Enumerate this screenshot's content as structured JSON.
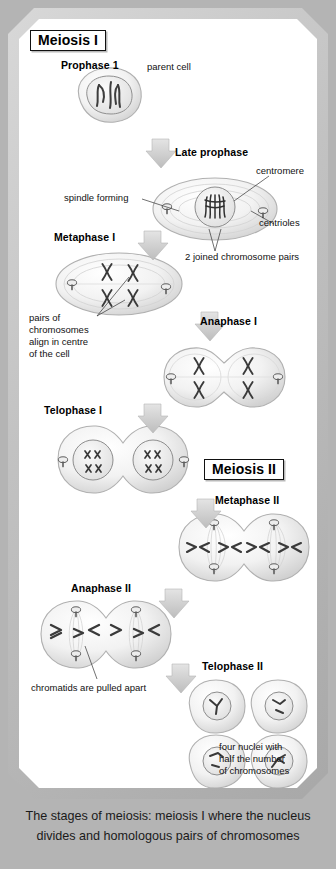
{
  "diagram": {
    "sections": [
      {
        "id": "meiosis-1",
        "label": "Meiosis I"
      },
      {
        "id": "meiosis-2",
        "label": "Meiosis II"
      }
    ],
    "phases": [
      {
        "id": "prophase-1",
        "label": "Prophase 1"
      },
      {
        "id": "late-prophase",
        "label": "Late prophase"
      },
      {
        "id": "metaphase-1",
        "label": "Metaphase I"
      },
      {
        "id": "anaphase-1",
        "label": "Anaphase I"
      },
      {
        "id": "telophase-1",
        "label": "Telophase I"
      },
      {
        "id": "metaphase-2",
        "label": "Metaphase II"
      },
      {
        "id": "anaphase-2",
        "label": "Anaphase II"
      },
      {
        "id": "telophase-2",
        "label": "Telophase II"
      }
    ],
    "annotations": [
      {
        "id": "parent-cell",
        "text": "parent cell"
      },
      {
        "id": "centromere",
        "text": "centromere"
      },
      {
        "id": "spindle-forming",
        "text": "spindle forming"
      },
      {
        "id": "centrioles",
        "text": "centrioles"
      },
      {
        "id": "joined-pairs",
        "text": "2 joined chromosome pairs"
      },
      {
        "id": "pairs-align-1",
        "text": "pairs of"
      },
      {
        "id": "pairs-align-2",
        "text": "chromosomes"
      },
      {
        "id": "pairs-align-3",
        "text": "align in centre"
      },
      {
        "id": "pairs-align-4",
        "text": "of the cell"
      },
      {
        "id": "chromatids-apart",
        "text": "chromatids are pulled apart"
      },
      {
        "id": "four-nuclei-1",
        "text": "four nuclei with"
      },
      {
        "id": "four-nuclei-2",
        "text": "half the number"
      },
      {
        "id": "four-nuclei-3",
        "text": "of chromosomes"
      }
    ],
    "caption": {
      "line1": "The stages of meiosis: meiosis I where the nucleus",
      "line2": "divides and homologous pairs of chromosomes"
    },
    "colors": {
      "page_background": "#b4b4b4",
      "frame": "#c2c2c2",
      "panel": "#ffffff",
      "ink": "#111111",
      "cell_outline": "#9a9a9a",
      "chromosome": "#3a3a3a",
      "arrow": "#cfcfcf"
    }
  }
}
